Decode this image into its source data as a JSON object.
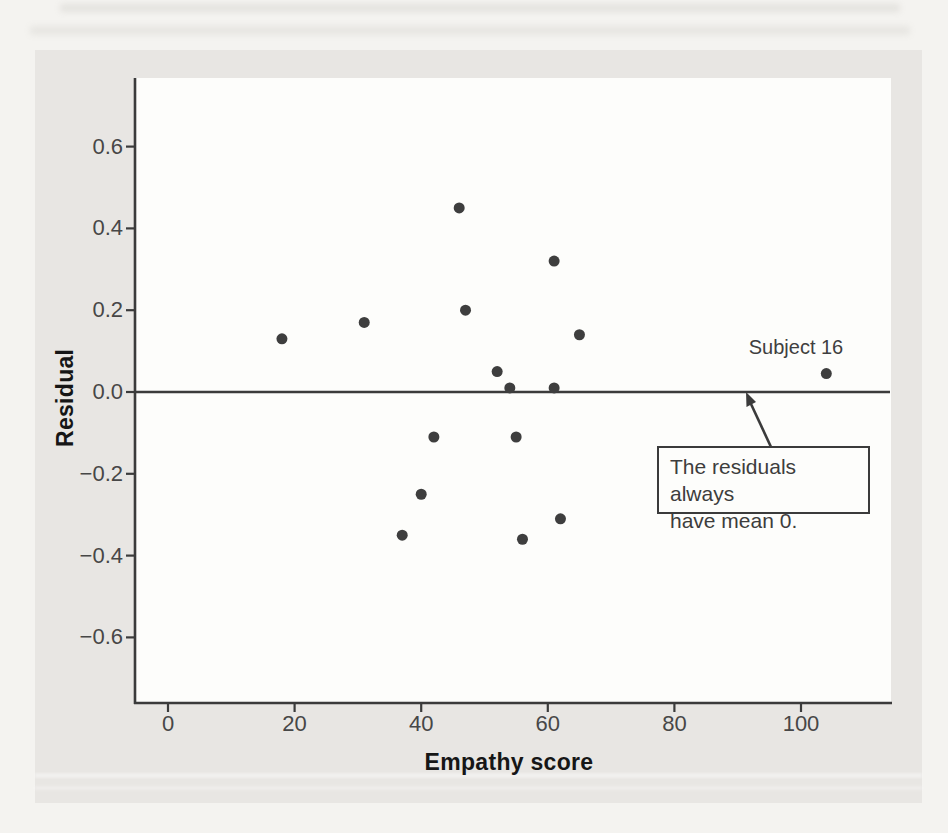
{
  "figure": {
    "ylabel": "Residual",
    "xlabel": "Empathy score",
    "point_label": "Subject 16",
    "annotation": {
      "line1": "The residuals always",
      "line2": "have mean 0."
    }
  },
  "chart_data": {
    "type": "scatter",
    "title": "",
    "xlabel": "Empathy score",
    "ylabel": "Residual",
    "xlim": [
      -5,
      114
    ],
    "ylim": [
      -0.76,
      0.77
    ],
    "grid": false,
    "reference_line_y": 0,
    "xticks": {
      "values": [
        0,
        20,
        40,
        60,
        80,
        100
      ],
      "labels": [
        "0",
        "20",
        "40",
        "60",
        "80",
        "100"
      ]
    },
    "yticks": {
      "values": [
        0.6,
        0.4,
        0.2,
        0.0,
        -0.2,
        -0.4,
        -0.6
      ],
      "labels": [
        "0.6",
        "0.4",
        "0.2",
        "0.0",
        "−0.2",
        "−0.4",
        "−0.6"
      ]
    },
    "points": [
      {
        "x": 18,
        "y": 0.13
      },
      {
        "x": 31,
        "y": 0.17
      },
      {
        "x": 46,
        "y": 0.45
      },
      {
        "x": 47,
        "y": 0.2
      },
      {
        "x": 61,
        "y": 0.32
      },
      {
        "x": 65,
        "y": 0.14
      },
      {
        "x": 52,
        "y": 0.05
      },
      {
        "x": 54,
        "y": 0.01
      },
      {
        "x": 61,
        "y": 0.01
      },
      {
        "x": 104,
        "y": 0.045,
        "label": "Subject 16"
      },
      {
        "x": 42,
        "y": -0.11
      },
      {
        "x": 55,
        "y": -0.11
      },
      {
        "x": 40,
        "y": -0.25
      },
      {
        "x": 62,
        "y": -0.31
      },
      {
        "x": 37,
        "y": -0.35
      },
      {
        "x": 56,
        "y": -0.36
      }
    ],
    "annotation": {
      "text_lines": [
        "The residuals always",
        "have mean 0."
      ],
      "arrow_points_to": "zero residual line"
    }
  },
  "colors": {
    "page_bg": "#f4f3f0",
    "panel_bg": "#e8e6e3",
    "plot_bg": "#fdfdfb",
    "ink": "#3b3b3b",
    "tick_text": "#474747",
    "bold_text": "#161616"
  }
}
